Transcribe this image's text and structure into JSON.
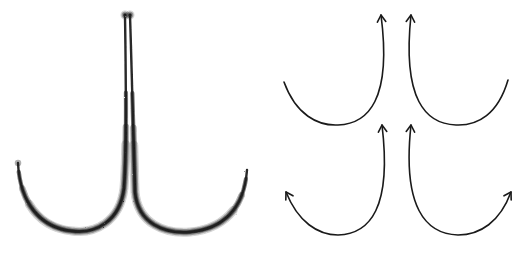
{
  "figure": {
    "background": "#ffffff",
    "ink_color": "#1a1a1a",
    "left_panel": {
      "description": "two brush strokes descending vertically, meeting at center and sweeping outward into U-curves",
      "strokes": [
        {
          "name": "left-brush-stroke",
          "path": "M125 15 C126 80 127 150 124 188 C120 222 95 234 72 231 C42 228 20 205 18 163"
        },
        {
          "name": "right-brush-stroke",
          "path": "M130 15 C132 80 134 150 135 192 C138 224 165 234 190 232 C222 229 244 210 247 170"
        }
      ]
    },
    "right_panel": {
      "description": "four curved arrows arranged in a 2x2 grid",
      "arrows": [
        {
          "name": "top-left-arc-arrow",
          "path": "M284 82 C296 115 318 126 338 125 C368 124 392 100 381 15",
          "heads": [
            {
              "x": 381,
              "y": 15,
              "angle": -95
            }
          ]
        },
        {
          "name": "top-right-arc-arrow",
          "path": "M411 15 C402 100 426 124 456 125 C478 126 498 114 508 80",
          "heads": [
            {
              "x": 411,
              "y": 15,
              "angle": -85
            }
          ]
        },
        {
          "name": "bottom-left-arc-arrow",
          "path": "M286 192 C298 222 318 235 338 235 C370 234 392 208 382 125",
          "heads": [
            {
              "x": 286,
              "y": 192,
              "angle": -120
            },
            {
              "x": 382,
              "y": 125,
              "angle": -95
            }
          ]
        },
        {
          "name": "bottom-right-arc-arrow",
          "path": "M411 125 C402 208 426 234 458 235 C480 235 500 222 511 192",
          "heads": [
            {
              "x": 411,
              "y": 125,
              "angle": -85
            },
            {
              "x": 511,
              "y": 192,
              "angle": -60
            }
          ]
        }
      ]
    }
  }
}
